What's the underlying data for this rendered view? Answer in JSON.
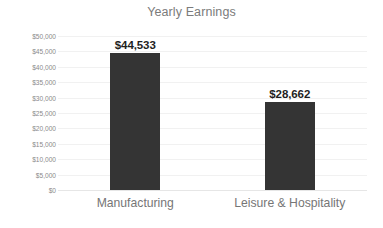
{
  "chart_data": {
    "type": "bar",
    "title": "Yearly Earnings",
    "xlabel": "",
    "ylabel": "",
    "categories": [
      "Manufacturing",
      "Leisure & Hospitality"
    ],
    "values": [
      44533,
      28662
    ],
    "data_labels": [
      "$44,533",
      "$28,662"
    ],
    "ylim": [
      0,
      50000
    ],
    "ytick_values": [
      50000,
      45000,
      40000,
      35000,
      30000,
      25000,
      20000,
      15000,
      10000,
      5000,
      0
    ],
    "ytick_labels": [
      "$50,000",
      "$45,000",
      "$40,000",
      "$35,000",
      "$30,000",
      "$25,000",
      "$20,000",
      "$15,000",
      "$10,000",
      "$5,000",
      "$0"
    ],
    "grid": true,
    "grid_axis": "y",
    "legend": false,
    "legend_position": "none",
    "series": [
      {
        "name": "Yearly Earnings",
        "values": [
          44533,
          28662
        ],
        "color": "#343434"
      }
    ],
    "colors": {
      "bar": "#343434",
      "gridline": "#f1f1f1",
      "baseline": "#e6e6e6",
      "title_text": "#7b7b7b",
      "tick_text": "#8a8a8a",
      "category_text": "#767676",
      "value_label_text": "#1f1f1f",
      "background": "#ffffff"
    }
  }
}
